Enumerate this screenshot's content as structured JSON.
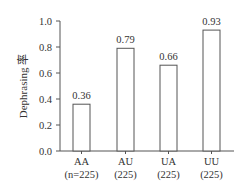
{
  "chart_data": {
    "type": "bar",
    "title": "",
    "xlabel": "",
    "ylabel": "Dephrasing 率",
    "ylim": [
      0.0,
      1.0
    ],
    "yticks": [
      "0.0",
      "0.2",
      "0.4",
      "0.6",
      "0.8",
      "1.0"
    ],
    "grid": false,
    "legend": null,
    "categories": [
      "AA",
      "AU",
      "UA",
      "UU"
    ],
    "category_sublabels": [
      "(n=225)",
      "(225)",
      "(225)",
      "(225)"
    ],
    "values": [
      0.36,
      0.79,
      0.66,
      0.93
    ],
    "value_labels": [
      "0.36",
      "0.79",
      "0.66",
      "0.93"
    ],
    "bar_fill": "#ffffff",
    "bar_stroke": "#555555"
  }
}
